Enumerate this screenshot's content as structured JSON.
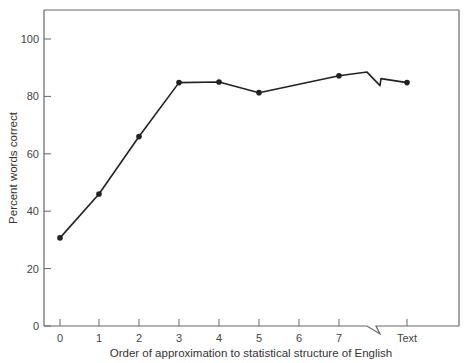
{
  "chart_data": {
    "type": "line",
    "title": "",
    "xlabel": "Order of approximation to statistical structure of English",
    "ylabel": "Percent words correct",
    "categories": [
      "0",
      "1",
      "2",
      "3",
      "4",
      "5",
      "6",
      "7",
      "Text"
    ],
    "x_ticks": [
      "0",
      "1",
      "2",
      "3",
      "4",
      "5",
      "6",
      "7",
      "Text"
    ],
    "y_ticks": [
      0,
      20,
      40,
      60,
      80,
      100
    ],
    "ylim": [
      0,
      110
    ],
    "grid": false,
    "legend": null,
    "axis_break": "between 7 and Text",
    "series": [
      {
        "name": "Percent words correct",
        "points": [
          {
            "x": "0",
            "y": 30.7
          },
          {
            "x": "1",
            "y": 46
          },
          {
            "x": "2",
            "y": 66
          },
          {
            "x": "3",
            "y": 84.8
          },
          {
            "x": "4",
            "y": 85
          },
          {
            "x": "5",
            "y": 81.3
          },
          {
            "x": "7",
            "y": 87.2
          },
          {
            "x": "Text",
            "y": 84.8
          }
        ]
      }
    ]
  },
  "colors": {
    "line": "#222222",
    "axis": "#666666",
    "text": "#444444"
  }
}
